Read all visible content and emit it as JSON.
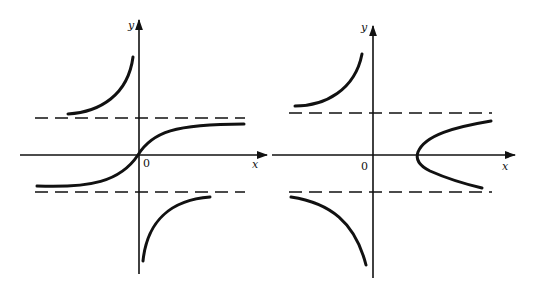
{
  "figure": {
    "panels": [
      {
        "id": "left",
        "axis_labels": {
          "x": "x",
          "y": "y",
          "origin": "0"
        },
        "asymptotes": "two horizontal dashed lines above and below x-axis",
        "curves": [
          "upper-left branch rising to y-axis",
          "S-curve through origin between asymptotes",
          "lower-right branch rising from below y-axis"
        ]
      },
      {
        "id": "right",
        "axis_labels": {
          "x": "x",
          "y": "y",
          "origin": "0"
        },
        "asymptotes": "two horizontal dashed lines above and below x-axis",
        "curves": [
          "upper-left branch rising to y-axis",
          "lower-left branch falling to y-axis",
          "sideways parabola opening right, vertex on positive x-axis"
        ]
      }
    ],
    "colors": {
      "ink": "#111111",
      "background": "#ffffff"
    }
  }
}
